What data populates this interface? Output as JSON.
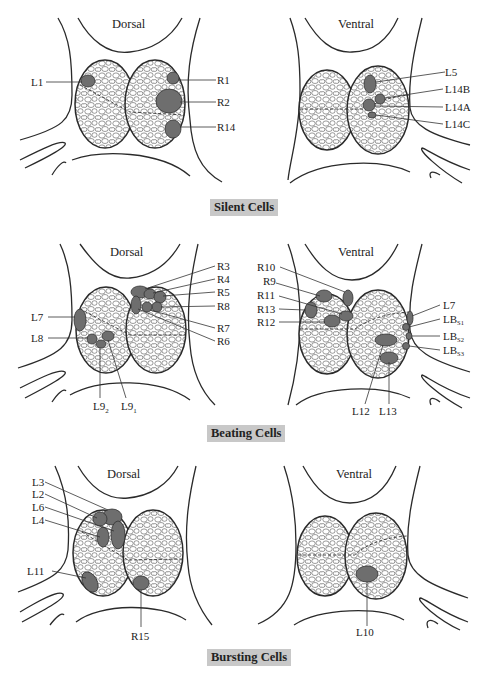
{
  "panels": [
    {
      "caption": "Silent Cells",
      "dorsal": {
        "title": "Dorsal",
        "labels": [
          "L1",
          "R1",
          "R2",
          "R14"
        ]
      },
      "ventral": {
        "title": "Ventral",
        "labels": [
          "L5",
          "L14B",
          "L14A",
          "L14C"
        ]
      }
    },
    {
      "caption": "Beating Cells",
      "dorsal": {
        "title": "Dorsal",
        "labels": [
          "R3",
          "R4",
          "R5",
          "R8",
          "R7",
          "R6",
          "L7",
          "L8",
          "L9",
          "2",
          "L9",
          "1"
        ]
      },
      "ventral": {
        "title": "Ventral",
        "labels": [
          "R10",
          "R9",
          "R11",
          "R13",
          "R12",
          "L7",
          "LB",
          "S1",
          "LB",
          "S2",
          "LB",
          "S3",
          "L12",
          "L13"
        ]
      }
    },
    {
      "caption": "Bursting Cells",
      "dorsal": {
        "title": "Dorsal",
        "labels": [
          "L3",
          "L2",
          "L6",
          "L4",
          "L11",
          "R15"
        ]
      },
      "ventral": {
        "title": "Ventral",
        "labels": [
          "L10"
        ]
      }
    }
  ],
  "colors": {
    "cell_fill": "#6e6e6e",
    "caption_bg": "#c8c8c8",
    "line": "#2a2a2a"
  }
}
